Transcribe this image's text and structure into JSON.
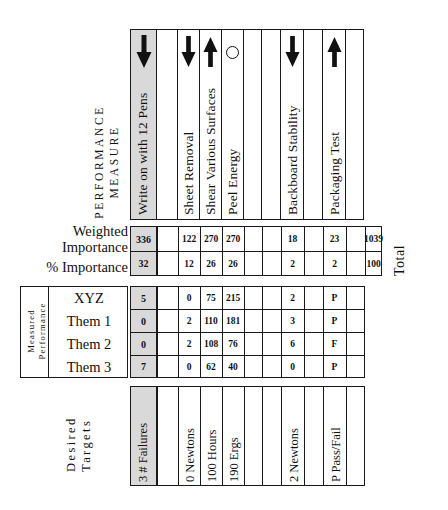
{
  "diagram": {
    "side_captions": {
      "performance_measure_line1": "PERFORMANCE",
      "performance_measure_line2": "MEASURE",
      "measured_performance_line1": "Measured",
      "measured_performance_line2": "Performance",
      "total_label": "Total",
      "desired_line1": "Desired",
      "desired_line2": "Targets"
    },
    "row_labels": {
      "weighted_line1": "Weighted",
      "weighted_line2": "Importance",
      "percent_importance": "% Importance",
      "percent_symbol": "%",
      "xyz": "XYZ",
      "them1": "Them 1",
      "them2": "Them 2",
      "them3": "Them 3"
    },
    "columns": [
      {
        "id": "c1",
        "header": "Write on with 12 Pens",
        "symbol": "arrow-down",
        "shaded": true
      },
      {
        "id": "c2",
        "header": "",
        "symbol": "none",
        "shaded": false
      },
      {
        "id": "c3",
        "header": "Sheet Removal",
        "symbol": "arrow-down",
        "shaded": false
      },
      {
        "id": "c4",
        "header": "Shear Various Surfaces",
        "symbol": "arrow-up",
        "shaded": false
      },
      {
        "id": "c5",
        "header": "Peel Energy",
        "symbol": "circle",
        "shaded": false
      },
      {
        "id": "c6",
        "header": "",
        "symbol": "none",
        "shaded": false
      },
      {
        "id": "c7",
        "header": "",
        "symbol": "none",
        "shaded": false
      },
      {
        "id": "c8",
        "header": "Backboard Stability",
        "symbol": "arrow-down",
        "shaded": false
      },
      {
        "id": "c9",
        "header": "",
        "symbol": "none",
        "shaded": false
      },
      {
        "id": "c10",
        "header": "Packaging Test",
        "symbol": "arrow-up",
        "shaded": false
      },
      {
        "id": "c11",
        "header": "",
        "symbol": "none",
        "shaded": false
      }
    ],
    "rows": {
      "weighted_importance": [
        "336",
        "",
        "122",
        "270",
        "270",
        "",
        "",
        "18",
        "",
        "23",
        ""
      ],
      "weighted_importance_total": "1039",
      "percent_importance": [
        "32",
        "",
        "12",
        "26",
        "26",
        "",
        "",
        "2",
        "",
        "2",
        ""
      ],
      "percent_importance_total": "100",
      "xyz": [
        "5",
        "",
        "0",
        "75",
        "215",
        "",
        "",
        "2",
        "",
        "P",
        ""
      ],
      "them1": [
        "0",
        "",
        "2",
        "110",
        "181",
        "",
        "",
        "3",
        "",
        "P",
        ""
      ],
      "them2": [
        "0",
        "",
        "2",
        "108",
        "76",
        "",
        "",
        "6",
        "",
        "F",
        ""
      ],
      "them3": [
        "7",
        "",
        "0",
        "62",
        "40",
        "",
        "",
        "0",
        "",
        "P",
        ""
      ],
      "desired_targets": [
        "3  # Failures",
        "",
        "0  Newtons",
        "100  Hours",
        "190  Ergs",
        "",
        "",
        "2  Newtons",
        "",
        "P  Pass/Fail",
        ""
      ]
    },
    "colors": {
      "line": "#1a1a1a",
      "shade": "#d9d9d9",
      "background": "#ffffff",
      "text": "#111111"
    }
  }
}
